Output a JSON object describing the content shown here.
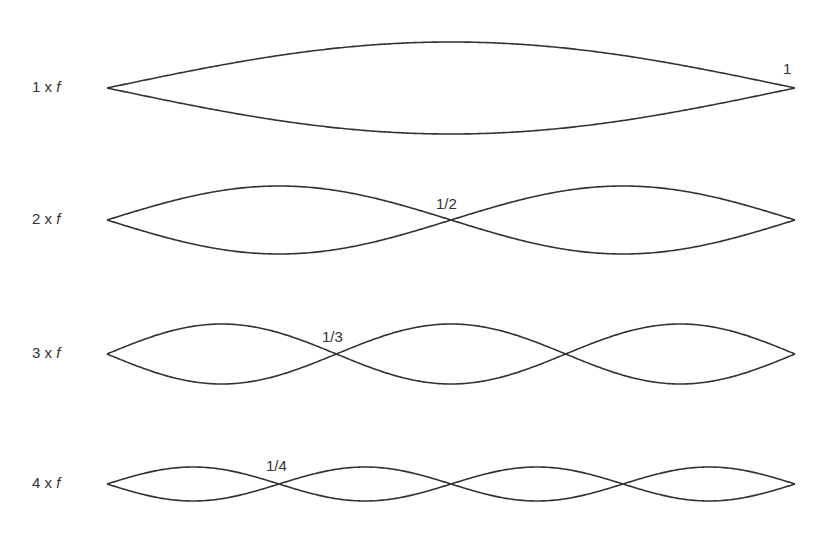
{
  "diagram": {
    "title": "",
    "x_start": 107,
    "x_end": 795,
    "stroke_color": "#333333",
    "rows": [
      {
        "id": "h1",
        "label_prefix": "1 x ",
        "label_var": "f",
        "harmonic": 1,
        "center_y": 88,
        "amplitude": 46,
        "node_label": "1",
        "node_label_x": 783,
        "node_label_y": 60,
        "label_y": 78
      },
      {
        "id": "h2",
        "label_prefix": "2 x ",
        "label_var": "f",
        "harmonic": 2,
        "center_y": 220,
        "amplitude": 34,
        "node_label": "1/2",
        "node_label_x": 436,
        "node_label_y": 195,
        "label_y": 210
      },
      {
        "id": "h3",
        "label_prefix": "3 x ",
        "label_var": "f",
        "harmonic": 3,
        "center_y": 354,
        "amplitude": 30,
        "node_label": "1/3",
        "node_label_x": 322,
        "node_label_y": 328,
        "label_y": 344
      },
      {
        "id": "h4",
        "label_prefix": "4 x ",
        "label_var": "f",
        "harmonic": 4,
        "center_y": 484,
        "amplitude": 17,
        "node_label": "1/4",
        "node_label_x": 266,
        "node_label_y": 457,
        "label_y": 474
      }
    ]
  }
}
